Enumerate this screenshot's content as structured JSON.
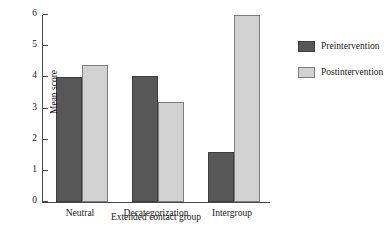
{
  "chart_data": {
    "type": "bar",
    "title": "",
    "subtitle": "",
    "xlabel": "Extended contact group",
    "ylabel": "Mean score",
    "categories": [
      "Neutral",
      "Decategorization",
      "Intergroup"
    ],
    "series": [
      {
        "name": "Preintervention",
        "color": "#575757",
        "values": [
          4.0,
          4.05,
          1.6
        ]
      },
      {
        "name": "Postintervention",
        "color": "#d2d2d2",
        "values": [
          4.4,
          3.2,
          6.0
        ]
      }
    ],
    "ylim": [
      0,
      6
    ],
    "yticks": [
      0,
      1,
      2,
      3,
      4,
      5,
      6
    ],
    "ytick_labels": [
      "0",
      "1",
      "2",
      "3",
      "4",
      "5",
      "6"
    ],
    "grid": false,
    "legend_position": "right",
    "annotations": []
  },
  "legend": {
    "entries": [
      {
        "label": "Preintervention",
        "color": "#575757"
      },
      {
        "label": "Postintervention",
        "color": "#d2d2d2"
      }
    ]
  },
  "colors": {
    "preintervention": "#575757",
    "postintervention": "#d2d2d2",
    "axis": "#4a4a4a",
    "background": "#ffffff",
    "text": "#1a1a1a"
  }
}
